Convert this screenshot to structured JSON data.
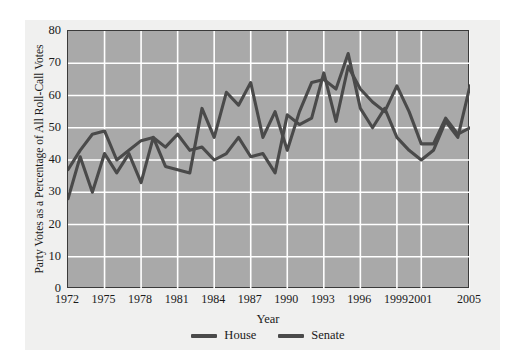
{
  "chart_data": {
    "type": "line",
    "title": "",
    "xlabel": "Year",
    "ylabel": "Party Votes as a Percentage of All Roll-Call Votes",
    "xlim": [
      1972,
      2005
    ],
    "ylim": [
      0,
      80
    ],
    "yticks": [
      0,
      10,
      20,
      30,
      40,
      50,
      60,
      70,
      80
    ],
    "xticks": [
      1972,
      1975,
      1978,
      1981,
      1984,
      1987,
      1990,
      1993,
      1996,
      1999,
      2001,
      2005
    ],
    "xtick_labels": [
      "1972",
      "1975",
      "1978",
      "1981",
      "1984",
      "1987",
      "1990",
      "1993",
      "1996",
      "1999",
      "2001",
      "2005"
    ],
    "grid": true,
    "grid_color": "#ffffff",
    "plot_background": "#a9a9a9",
    "legend_position": "bottom-center",
    "x": [
      1972,
      1973,
      1974,
      1975,
      1976,
      1977,
      1978,
      1979,
      1980,
      1981,
      1982,
      1983,
      1984,
      1985,
      1986,
      1987,
      1988,
      1989,
      1990,
      1991,
      1992,
      1993,
      1994,
      1995,
      1996,
      1997,
      1998,
      1999,
      2000,
      2001,
      2002,
      2003,
      2004,
      2005
    ],
    "series": [
      {
        "name": "House",
        "color": "#4a4a4a",
        "values": [
          28,
          41,
          30,
          42,
          36,
          42,
          33,
          47,
          38,
          37,
          36,
          56,
          47,
          61,
          57,
          64,
          47,
          55,
          43,
          55,
          64,
          65,
          62,
          73,
          56,
          50,
          56,
          47,
          43,
          40,
          43,
          52,
          47,
          63
        ]
      },
      {
        "name": "Senate",
        "color": "#4a4a4a",
        "values": [
          37,
          43,
          48,
          49,
          40,
          43,
          46,
          47,
          44,
          48,
          43,
          44,
          40,
          42,
          47,
          41,
          42,
          36,
          54,
          51,
          53,
          67,
          52,
          69,
          62,
          58,
          55,
          63,
          55,
          45,
          45,
          53,
          48,
          50
        ]
      }
    ]
  },
  "legend": {
    "items": [
      {
        "label": "House",
        "color": "#4a4a4a"
      },
      {
        "label": "Senate",
        "color": "#4a4a4a"
      }
    ]
  }
}
